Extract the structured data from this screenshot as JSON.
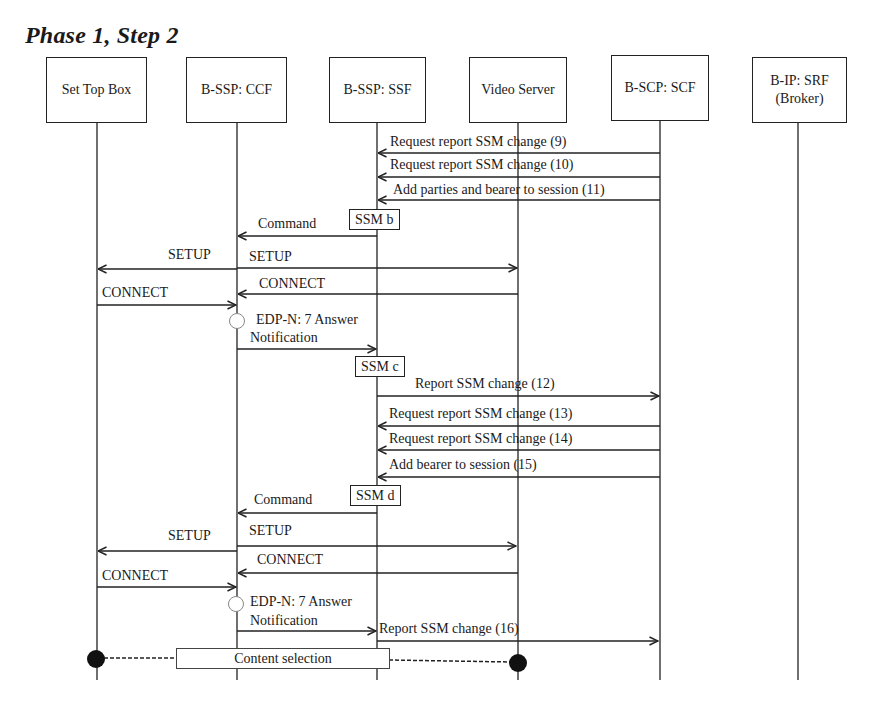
{
  "title": "Phase 1, Step 2",
  "colors": {
    "line": "#222222",
    "background": "#ffffff",
    "dot": "#111111"
  },
  "participants": [
    {
      "id": "stb",
      "label": "Set Top Box"
    },
    {
      "id": "ccf",
      "label": "B-SSP: CCF"
    },
    {
      "id": "ssf",
      "label": "B-SSP: SSF"
    },
    {
      "id": "vs",
      "label": "Video Server"
    },
    {
      "id": "scf",
      "label": "B-SCP: SCF"
    },
    {
      "id": "srf",
      "label": "B-IP: SRF (Broker)",
      "line1": "B-IP: SRF",
      "line2": "(Broker)"
    }
  ],
  "messages": [
    {
      "from": "scf",
      "to": "ssf",
      "label": "Request report SSM change (9)"
    },
    {
      "from": "scf",
      "to": "ssf",
      "label": "Request report SSM change (10)"
    },
    {
      "from": "scf",
      "to": "ssf",
      "label": "Add parties and bearer to session (11)"
    },
    {
      "from": "ssf",
      "to": "ccf",
      "label": "Command"
    },
    {
      "from": "ccf",
      "to": "stb",
      "label": "SETUP"
    },
    {
      "from": "ccf",
      "to": "vs",
      "label": "SETUP"
    },
    {
      "from": "vs",
      "to": "ccf",
      "label": "CONNECT"
    },
    {
      "from": "stb",
      "to": "ccf",
      "label": "CONNECT"
    },
    {
      "from": "ccf",
      "to": "ssf",
      "label": "EDP-N: 7 Answer Notification",
      "line1": "EDP-N: 7 Answer",
      "line2": "Notification"
    },
    {
      "from": "ssf",
      "to": "scf",
      "label": "Report SSM change (12)"
    },
    {
      "from": "scf",
      "to": "ssf",
      "label": "Request report SSM change (13)"
    },
    {
      "from": "scf",
      "to": "ssf",
      "label": "Request report SSM change (14)"
    },
    {
      "from": "scf",
      "to": "ssf",
      "label": "Add bearer to session (15)"
    },
    {
      "from": "ssf",
      "to": "ccf",
      "label": "Command"
    },
    {
      "from": "ccf",
      "to": "stb",
      "label": "SETUP"
    },
    {
      "from": "ccf",
      "to": "vs",
      "label": "SETUP"
    },
    {
      "from": "vs",
      "to": "ccf",
      "label": "CONNECT"
    },
    {
      "from": "stb",
      "to": "ccf",
      "label": "CONNECT"
    },
    {
      "from": "ccf",
      "to": "ssf",
      "label": "EDP-N: 7 Answer Notification",
      "line1": "EDP-N: 7 Answer",
      "line2": "Notification"
    },
    {
      "from": "ssf",
      "to": "scf",
      "label": "Report SSM change (16)"
    }
  ],
  "states": [
    {
      "label": "SSM b"
    },
    {
      "label": "SSM c"
    },
    {
      "label": "SSM d"
    }
  ],
  "footer": {
    "label": "Content selection",
    "from": "stb",
    "to": "vs"
  }
}
